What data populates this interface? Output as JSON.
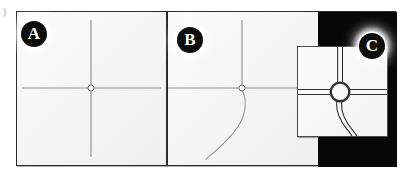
{
  "figure": {
    "watermark_mark": "❵",
    "background_color": "#f7f7f5",
    "frame_color": "#2b2b2b",
    "panel_count": 3
  },
  "badges": [
    {
      "label": "A",
      "name": "panel-label-a"
    },
    {
      "label": "B",
      "name": "panel-label-b"
    },
    {
      "label": "C",
      "name": "panel-label-c"
    }
  ],
  "panels": {
    "a": {
      "label": "A",
      "description": "Simple four-arm crossroad skeleton with single-line road centrelines meeting at one node.",
      "road_color": "#8d8d8d",
      "node_fill": "#ffffff",
      "node_stroke": "#6f6f6f"
    },
    "b": {
      "label": "B",
      "description": "Crossroad skeleton with an additional curved slip-road branching from the node toward the lower left.",
      "road_color": "#8d8d8d",
      "curve_color": "#9a9a9a",
      "node_fill": "#ffffff",
      "node_stroke": "#6f6f6f"
    },
    "c": {
      "label": "C",
      "description": "Detailed inset of the junction drawn as a roundabout with double-line carriageways on all four approaches and a curved slip road leaving to the lower right.",
      "backdrop_color": "#070707",
      "road_color": "#2f2f2f",
      "roundabout_fill": "#fbfbfa",
      "roundabout_stroke": "#2f2f2f"
    }
  }
}
